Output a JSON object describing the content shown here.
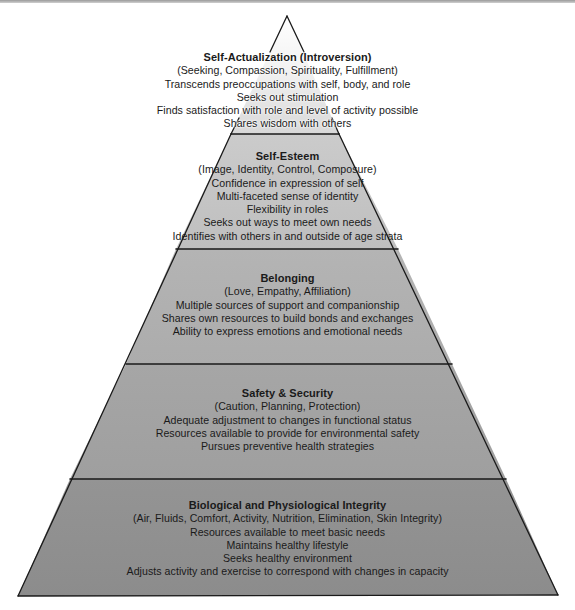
{
  "diagram": {
    "type": "pyramid",
    "colors": {
      "tier1_fill_top": "#ffffff",
      "tier1_fill_bottom": "#dcdcdc",
      "tier2_fill": "#c4c4c4",
      "tier3_fill": "#b0b0b0",
      "tier4_fill": "#a3a3a3",
      "tier5_fill": "#919191",
      "outline": "#1a1a1a"
    },
    "tiers": [
      {
        "title": "Self-Actualization (Introversion)",
        "lines": [
          "(Seeking, Compassion, Spirituality, Fulfillment)",
          "Transcends preoccupations with self, body, and role",
          "Seeks out stimulation",
          "Finds satisfaction with role and level of activity possible",
          "Shares wisdom with others"
        ]
      },
      {
        "title": "Self-Esteem",
        "lines": [
          "(Image, Identity, Control, Composure)",
          "Confidence in expression of self",
          "Multi-faceted sense of identity",
          "Flexibility in roles",
          "Seeks out ways to meet own needs",
          "Identifies with others in and outside of age strata"
        ]
      },
      {
        "title": "Belonging",
        "lines": [
          "(Love, Empathy, Affiliation)",
          "Multiple sources of support and companionship",
          "Shares own resources to build bonds and exchanges",
          "Ability to express emotions and emotional needs"
        ]
      },
      {
        "title": "Safety & Security",
        "lines": [
          "(Caution, Planning, Protection)",
          "Adequate adjustment to changes in functional status",
          "Resources available to provide for environmental safety",
          "Pursues preventive health strategies"
        ]
      },
      {
        "title": "Biological and Physiological Integrity",
        "lines": [
          "(Air, Fluids, Comfort, Activity, Nutrition, Elimination, Skin Integrity)",
          "Resources available to meet basic needs",
          "Maintains healthy lifestyle",
          "Seeks healthy environment",
          "Adjusts activity and exercise to correspond with changes in capacity"
        ]
      }
    ]
  }
}
